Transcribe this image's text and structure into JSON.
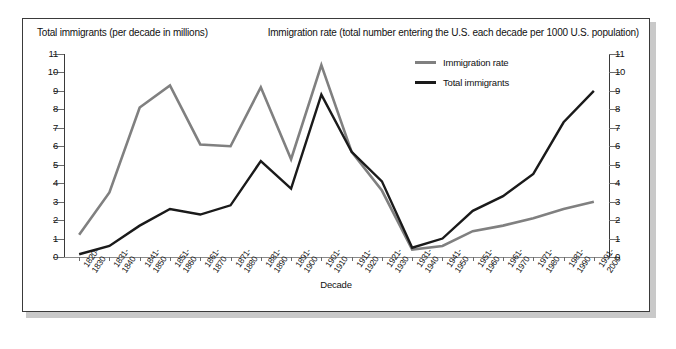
{
  "titles": {
    "left_axis_title": "Total immigrants (per decade in millions)",
    "right_axis_title": "Immigration rate (total number entering the U.S. each decade per 1000 U.S. population)"
  },
  "legend": {
    "items": [
      {
        "label": "Immigration rate",
        "color": "#808080"
      },
      {
        "label": "Total immigrants",
        "color": "#1a1a1a"
      }
    ]
  },
  "chart_data": {
    "type": "line",
    "title": "",
    "xlabel": "Decade",
    "ylabel": "Total immigrants (per decade in millions)",
    "y2label": "Immigration rate (total number entering the U.S. each decade per 1000 U.S. population)",
    "ylim": [
      0,
      11
    ],
    "y2lim": [
      0,
      11
    ],
    "yticks": [
      "0",
      "1",
      "2",
      "3",
      "4",
      "5",
      "6",
      "7",
      "8",
      "9",
      "10",
      "11"
    ],
    "y2ticks": [
      "0",
      "1",
      "2",
      "3",
      "4",
      "5",
      "6",
      "7",
      "8",
      "9",
      "10",
      "11"
    ],
    "grid": false,
    "legend_position": "top-right",
    "categories": [
      "1820-\n1830",
      "1831-\n1840",
      "1841-\n1850",
      "1851-\n1860",
      "1861-\n1870",
      "1871-\n1880",
      "1881-\n1890",
      "1891-\n1900",
      "1901-\n1910",
      "1911-\n1920",
      "1921-\n1930",
      "1931-\n1940",
      "1941-\n1950",
      "1951-\n1960",
      "1961-\n1970",
      "1971-\n1980",
      "1981-\n1990",
      "1991-\n2000"
    ],
    "categories_line1": [
      "1820-",
      "1831-",
      "1841-",
      "1851-",
      "1861-",
      "1871-",
      "1881-",
      "1891-",
      "1901-",
      "1911-",
      "1921-",
      "1931-",
      "1941-",
      "1951-",
      "1961-",
      "1971-",
      "1981-",
      "1991-"
    ],
    "categories_line2": [
      "1830",
      "1840",
      "1850",
      "1860",
      "1870",
      "1880",
      "1890",
      "1900",
      "1910",
      "1920",
      "1930",
      "1940",
      "1950",
      "1960",
      "1970",
      "1980",
      "1990",
      "2000"
    ],
    "series": [
      {
        "name": "Immigration rate",
        "color": "#808080",
        "values": [
          1.2,
          3.5,
          8.1,
          9.3,
          6.1,
          6.0,
          9.2,
          5.3,
          10.4,
          5.7,
          3.6,
          0.4,
          0.6,
          1.4,
          1.7,
          2.1,
          2.6,
          3.0
        ]
      },
      {
        "name": "Total immigrants",
        "color": "#1a1a1a",
        "values": [
          0.15,
          0.6,
          1.7,
          2.6,
          2.3,
          2.8,
          5.2,
          3.7,
          8.8,
          5.7,
          4.1,
          0.5,
          1.0,
          2.5,
          3.3,
          4.5,
          7.3,
          9.0
        ]
      }
    ]
  }
}
